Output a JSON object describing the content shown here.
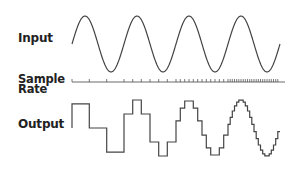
{
  "labels": {
    "input": "Input",
    "sample_rate_line1": "Sample",
    "sample_rate_line2": "Rate",
    "output": "Output"
  },
  "colors": {
    "stroke": "#444444",
    "text": "#222222",
    "background": "#ffffff"
  },
  "waveform": {
    "cycles": 4,
    "x_start": 72,
    "x_end": 280,
    "input_mid_y": 44,
    "input_amp": 28,
    "output_mid_y": 128,
    "output_amp": 28,
    "sample_line_y": 82,
    "samples_per_cycle": [
      3,
      6,
      12,
      24
    ]
  }
}
